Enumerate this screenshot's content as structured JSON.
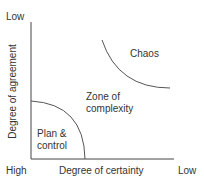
{
  "diagram": {
    "y_axis": {
      "label": "Degree of agreement",
      "top_label": "Low"
    },
    "x_axis": {
      "label": "Degree of certainty",
      "left_label": "High",
      "right_label": "Low"
    },
    "zones": {
      "plan_line1": "Plan &",
      "plan_line2": "control",
      "complexity_line1": "Zone of",
      "complexity_line2": "complexity",
      "chaos": "Chaos"
    },
    "colors": {
      "line": "#555555",
      "text": "#333333"
    }
  }
}
